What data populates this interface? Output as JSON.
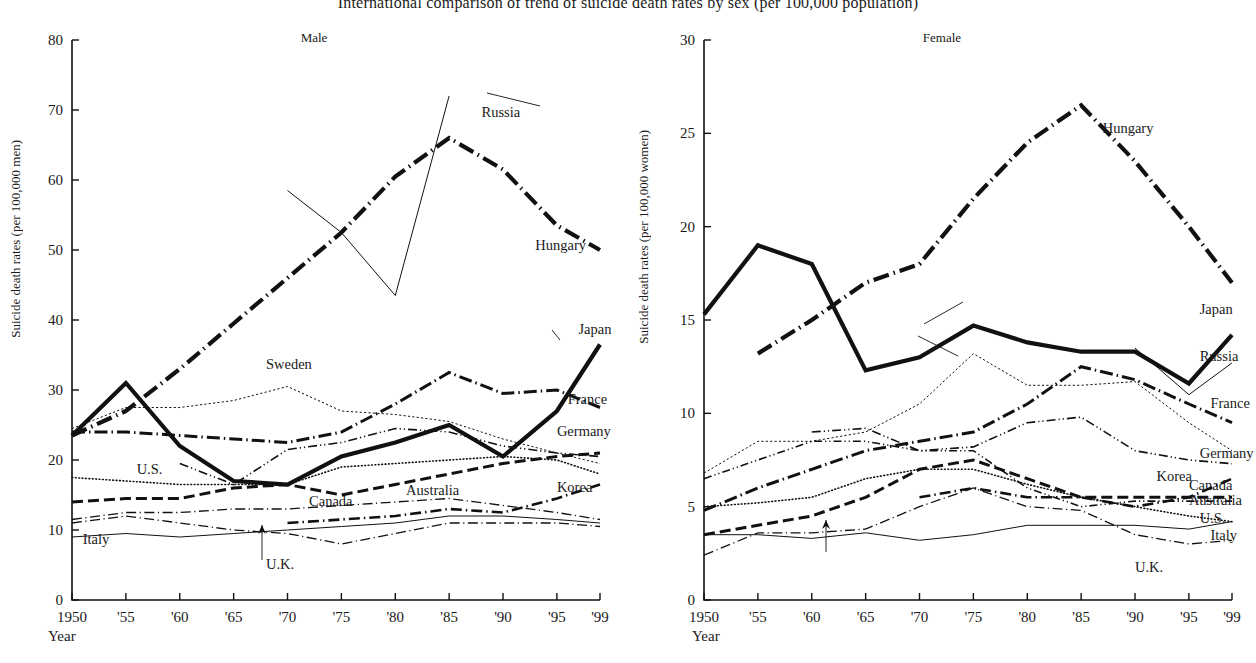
{
  "figure": {
    "title": "International comparison of trend of suicide death rates by sex (per 100,000 population)",
    "xlabel": "Year",
    "year_ticks": [
      "1950",
      "'55",
      "'60",
      "'65",
      "'70",
      "'75",
      "'80",
      "'85",
      "'90",
      "'95",
      "'99"
    ]
  },
  "chart_data": [
    {
      "type": "line",
      "title": "Male",
      "xlabel": "Year",
      "ylabel": "Suicide death rates (per 100,000 men)",
      "x": [
        1950,
        1955,
        1960,
        1965,
        1970,
        1975,
        1980,
        1985,
        1990,
        1995,
        1999
      ],
      "xtick_labels": [
        "1950",
        "'55",
        "'60",
        "'65",
        "'70",
        "'75",
        "'80",
        "'85",
        "'90",
        "'95",
        "'99"
      ],
      "xlim": [
        1950,
        1999
      ],
      "ylim": [
        0,
        80
      ],
      "ytick_labels": [
        "0",
        "10",
        "20",
        "30",
        "40",
        "50",
        "60",
        "70",
        "80"
      ],
      "grid": false,
      "legend": "inline-labels",
      "series": [
        {
          "name": "Hungary",
          "style": "dash-dot-very-thick",
          "values": [
            23.5,
            27.0,
            33.0,
            39.5,
            46.0,
            52.5,
            60.5,
            66.0,
            61.5,
            53.5,
            50.0
          ]
        },
        {
          "name": "Russia",
          "style": "thin-solid",
          "x": [
            1970,
            1980,
            1985,
            1990,
            1992,
            1995,
            1999
          ],
          "values": [
            null,
            null,
            null,
            null,
            58.5,
            52.5,
            43.5,
            72.0,
            null,
            null,
            null
          ]
        },
        {
          "name": "Japan",
          "style": "very-thick-solid",
          "values": [
            23.5,
            31.0,
            22.0,
            17.0,
            16.5,
            20.5,
            22.5,
            25.0,
            20.5,
            27.0,
            36.5
          ]
        },
        {
          "name": "France",
          "style": "dash-dot-thick",
          "values": [
            24.0,
            24.0,
            23.5,
            23.0,
            22.5,
            24.0,
            28.0,
            32.5,
            29.5,
            30.0,
            27.5
          ]
        },
        {
          "name": "Sweden",
          "style": "dotted-fine",
          "values": [
            24.5,
            27.5,
            27.5,
            28.5,
            30.5,
            27.0,
            26.5,
            25.5,
            23.0,
            21.0,
            19.5
          ]
        },
        {
          "name": "Germany",
          "style": "dash-dot-dot",
          "values": [
            null,
            null,
            19.5,
            16.5,
            21.5,
            22.5,
            24.5,
            24.0,
            22.0,
            21.0,
            20.5
          ]
        },
        {
          "name": "U.S.",
          "style": "dotted-round",
          "values": [
            17.5,
            17.0,
            16.5,
            16.5,
            16.5,
            19.0,
            19.5,
            20.0,
            20.5,
            20.0,
            18.0
          ]
        },
        {
          "name": "Australia",
          "style": "dashed-thick",
          "values": [
            14.0,
            14.5,
            14.5,
            16.0,
            16.5,
            15.0,
            16.5,
            18.0,
            19.5,
            20.5,
            21.0
          ]
        },
        {
          "name": "Canada",
          "style": "dash-dot-thin",
          "values": [
            11.5,
            12.5,
            12.5,
            13.0,
            13.0,
            13.5,
            14.0,
            14.5,
            13.5,
            12.5,
            11.5
          ]
        },
        {
          "name": "Korea",
          "style": "dash-dot-med",
          "values": [
            null,
            null,
            null,
            null,
            11.0,
            11.5,
            12.0,
            13.0,
            12.5,
            14.5,
            16.5
          ]
        },
        {
          "name": "Italy",
          "style": "thin-solid",
          "values": [
            9.0,
            9.5,
            9.0,
            9.5,
            10.0,
            10.5,
            11.0,
            12.0,
            12.0,
            11.5,
            11.0
          ]
        },
        {
          "name": "U.K.",
          "style": "dash-dot-thin",
          "values": [
            11.0,
            12.0,
            11.0,
            10.0,
            9.5,
            8.0,
            9.5,
            11.0,
            11.0,
            11.0,
            10.5
          ]
        }
      ],
      "annotations": [
        {
          "text": "Russia",
          "x": 1988,
          "y": 69
        },
        {
          "text": "Hungary",
          "x": 1993,
          "y": 50
        },
        {
          "text": "Japan",
          "x": 1997,
          "y": 38
        },
        {
          "text": "France",
          "x": 1996,
          "y": 28
        },
        {
          "text": "Germany",
          "x": 1995,
          "y": 23.5
        },
        {
          "text": "Korea",
          "x": 1995,
          "y": 15.5
        },
        {
          "text": "Australia",
          "x": 1981,
          "y": 15
        },
        {
          "text": "Sweden",
          "x": 1968,
          "y": 33
        },
        {
          "text": "U.S.",
          "x": 1956,
          "y": 18
        },
        {
          "text": "Canada",
          "x": 1972,
          "y": 13.5
        },
        {
          "text": "Italy",
          "x": 1951,
          "y": 8
        },
        {
          "text": "U.K.",
          "x": 1968,
          "y": 4.5
        }
      ]
    },
    {
      "type": "line",
      "title": "Female",
      "xlabel": "Year",
      "ylabel": "Suicide death rates (per 100,000 women)",
      "x": [
        1950,
        1955,
        1960,
        1965,
        1970,
        1975,
        1980,
        1985,
        1990,
        1995,
        1999
      ],
      "xtick_labels": [
        "1950",
        "'55",
        "'60",
        "'65",
        "'70",
        "'75",
        "'80",
        "'85",
        "'90",
        "'95",
        "'99"
      ],
      "xlim": [
        1950,
        1999
      ],
      "ylim": [
        0,
        30
      ],
      "ytick_labels": [
        "0",
        "5",
        "10",
        "15",
        "20",
        "25",
        "30"
      ],
      "grid": false,
      "legend": "inline-labels",
      "series": [
        {
          "name": "Hungary",
          "style": "dash-dot-very-thick",
          "values": [
            null,
            13.2,
            15.0,
            17.0,
            18.0,
            21.5,
            24.5,
            26.5,
            23.5,
            20.0,
            17.0
          ]
        },
        {
          "name": "Japan",
          "style": "very-thick-solid",
          "values": [
            15.3,
            19.0,
            18.0,
            12.3,
            13.0,
            14.7,
            13.8,
            13.3,
            13.3,
            11.6,
            14.2
          ]
        },
        {
          "name": "Russia",
          "style": "thin-solid",
          "x": [
            1990,
            1992,
            1995,
            1999
          ],
          "values": [
            null,
            null,
            null,
            null,
            null,
            null,
            null,
            null,
            13.5,
            11.0,
            12.7
          ]
        },
        {
          "name": "France",
          "style": "dash-dot-thick",
          "values": [
            4.8,
            6.0,
            7.0,
            8.0,
            8.5,
            9.0,
            10.5,
            12.5,
            11.8,
            10.5,
            9.5
          ]
        },
        {
          "name": "Sweden",
          "style": "dotted-fine",
          "values": [
            6.8,
            8.5,
            8.5,
            9.0,
            10.5,
            13.2,
            11.5,
            11.5,
            11.7,
            9.5,
            8.0
          ]
        },
        {
          "name": "Germany",
          "style": "dash-dot-dot",
          "values": [
            null,
            null,
            9.0,
            9.2,
            8.0,
            8.2,
            9.5,
            9.8,
            8.0,
            7.5,
            7.3
          ]
        },
        {
          "name": "Korea",
          "style": "dash-dot-med",
          "values": [
            null,
            null,
            null,
            null,
            5.5,
            6.0,
            5.5,
            5.5,
            5.0,
            5.5,
            6.5
          ]
        },
        {
          "name": "Canada",
          "style": "dashed-thick",
          "values": [
            3.5,
            4.0,
            4.5,
            5.5,
            7.0,
            7.5,
            6.5,
            5.5,
            5.5,
            5.5,
            5.5
          ]
        },
        {
          "name": "Australia",
          "style": "dash-dot-dot2",
          "values": [
            6.5,
            7.5,
            8.5,
            8.5,
            8.0,
            8.0,
            6.0,
            5.0,
            5.3,
            5.3,
            5.3
          ]
        },
        {
          "name": "U.S.",
          "style": "dotted-round",
          "values": [
            5.0,
            5.2,
            5.5,
            6.5,
            7.0,
            7.0,
            6.2,
            5.5,
            5.0,
            4.5,
            4.2
          ]
        },
        {
          "name": "Italy",
          "style": "thin-solid",
          "values": [
            3.5,
            3.5,
            3.3,
            3.6,
            3.2,
            3.5,
            4.0,
            4.0,
            4.0,
            3.8,
            4.2
          ]
        },
        {
          "name": "U.K.",
          "style": "dash-dot-thin",
          "values": [
            2.4,
            3.6,
            3.6,
            3.8,
            5.0,
            6.0,
            5.0,
            4.8,
            3.5,
            3.0,
            3.2
          ]
        }
      ],
      "annotations": [
        {
          "text": "Hungary",
          "x": 1987,
          "y": 25
        },
        {
          "text": "Japan",
          "x": 1996,
          "y": 15.3
        },
        {
          "text": "Russia",
          "x": 1996,
          "y": 12.8
        },
        {
          "text": "France",
          "x": 1997,
          "y": 10.3
        },
        {
          "text": "Germany",
          "x": 1996,
          "y": 7.6
        },
        {
          "text": "Korea",
          "x": 1992,
          "y": 6.4
        },
        {
          "text": "Canada",
          "x": 1995,
          "y": 5.9
        },
        {
          "text": "Australia",
          "x": 1995,
          "y": 5.1
        },
        {
          "text": "U.S.",
          "x": 1996,
          "y": 4.1
        },
        {
          "text": "Italy",
          "x": 1997,
          "y": 3.2
        },
        {
          "text": "U.K.",
          "x": 1990,
          "y": 1.5
        }
      ]
    }
  ]
}
